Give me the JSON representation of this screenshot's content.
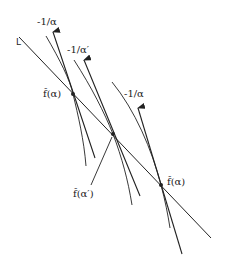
{
  "diagram": {
    "line_label": "L",
    "slope_labels": [
      {
        "id": "slope-1",
        "text": "-1/α"
      },
      {
        "id": "slope-2",
        "text": "-1/α′"
      },
      {
        "id": "slope-3",
        "text": "-1/α"
      }
    ],
    "point_labels": [
      {
        "id": "point-1",
        "text": "f̂(α)"
      },
      {
        "id": "point-2",
        "text": "f̂(α′)"
      },
      {
        "id": "point-3",
        "text": "f̂(α)"
      }
    ],
    "stroke_color": "#222222",
    "background_color": "#ffffff"
  }
}
